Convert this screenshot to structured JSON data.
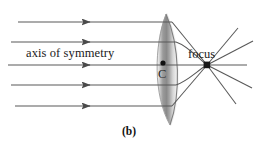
{
  "figure": {
    "caption": "(b)",
    "labels": {
      "axis": "axis of symmetry",
      "focus": "focus",
      "center": "C"
    },
    "colors": {
      "ray": "#555555",
      "mirror_edge": "#8c8c8c",
      "mirror_fill_light": "#f2f2f2",
      "mirror_fill_dark": "#7a7a7a",
      "point": "#111111",
      "text": "#1a1a1a",
      "background": "#ffffff"
    },
    "geometry": {
      "incoming_rays_y": [
        22,
        42,
        65,
        85,
        106
      ],
      "incoming_rays_start_x": [
        18,
        11,
        8,
        11,
        15
      ],
      "arrowhead_x": 90,
      "mirror_x_left": 152,
      "mirror_x_right": 181,
      "mirror_y_top": 13,
      "mirror_y_bottom": 126,
      "center_point": [
        163,
        63
      ],
      "focus_point": [
        207,
        65
      ],
      "canvas": [
        258,
        148
      ]
    },
    "icons": {
      "arrowhead": "arrowhead-icon",
      "center-dot": "dot-icon",
      "focus-dot": "square-dot-icon"
    }
  }
}
